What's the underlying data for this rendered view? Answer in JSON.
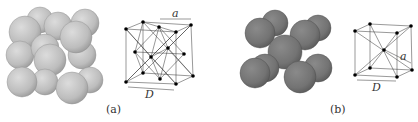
{
  "figure": {
    "panels": [
      {
        "id": "a",
        "caption": "(a)",
        "structure": "face-centered cubic",
        "dim_a": "a",
        "dim_D": "D"
      },
      {
        "id": "b",
        "caption": "(b)",
        "structure": "body-centered cubic",
        "dim_a": "a",
        "dim_D": "D"
      }
    ]
  },
  "colors": {
    "sphere_a": "#c4c4c4",
    "sphere_b": "#7a7a7a",
    "lattice": "#222222",
    "atom": "#000000"
  }
}
